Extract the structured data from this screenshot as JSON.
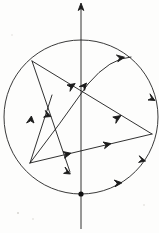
{
  "figure": {
    "title": "Circle with inscribed directed segments and arcs",
    "background_color": "#fdfdfc",
    "stroke_color": "#1b1b1b",
    "width": 159,
    "height": 233
  },
  "chart_data": {
    "type": "diagram",
    "title": "Circle with inscribed directed segments and arcs",
    "coordinate_system": "image pixels, origin top-left",
    "circle": {
      "label": "main-circle",
      "cx": 81,
      "cy": 117,
      "r": 77,
      "stroke": "#242424"
    },
    "axis": {
      "label": "vertical-axis",
      "x": 81,
      "y_top": 4,
      "y_bottom": 229,
      "arrow_at": "top",
      "arrow_point": [
        81,
        4
      ]
    },
    "points": [
      {
        "name": "A",
        "role": "upper-left-vertex",
        "x": 32,
        "y": 61
      },
      {
        "name": "B",
        "role": "lower-left-vertex",
        "x": 30,
        "y": 163
      },
      {
        "name": "C",
        "role": "right-vertex",
        "x": 152,
        "y": 134
      },
      {
        "name": "D",
        "role": "arrow-terminus-below-center",
        "x": 70,
        "y": 172
      },
      {
        "name": "E",
        "role": "axis-circle-bottom-node",
        "x": 81,
        "y": 194
      },
      {
        "name": "F",
        "role": "arc-upper-right-end",
        "x": 130,
        "y": 57
      }
    ],
    "segments": [
      {
        "name": "segment-A-to-C",
        "from": [
          32,
          61
        ],
        "to": [
          152,
          134
        ],
        "arrows": [
          {
            "t": 0.33,
            "dir": "forward"
          },
          {
            "t": 0.72,
            "dir": "forward"
          }
        ]
      },
      {
        "name": "segment-A-to-D",
        "from": [
          32,
          61
        ],
        "to": [
          70,
          172
        ],
        "arrows": [
          {
            "t": 0.48,
            "dir": "forward"
          },
          {
            "t": 1.0,
            "dir": "forward"
          }
        ]
      },
      {
        "name": "segment-B-to-A-upward",
        "from": [
          30,
          163
        ],
        "to": [
          52,
          95
        ],
        "arrows": [
          {
            "t": 0.62,
            "dir": "forward"
          }
        ]
      },
      {
        "name": "segment-B-to-C-lower",
        "from": [
          30,
          163
        ],
        "to": [
          152,
          134
        ],
        "arrows": [
          {
            "t": 0.32,
            "dir": "forward"
          },
          {
            "t": 0.72,
            "dir": "forward"
          }
        ]
      }
    ],
    "arcs": [
      {
        "name": "arc-B-to-F",
        "from": [
          30,
          163
        ],
        "to": [
          130,
          57
        ],
        "sweep": "counterclockwise-bulge-right",
        "arrows": [
          {
            "t": 0.55,
            "dir": "forward"
          },
          {
            "t": 0.93,
            "dir": "forward"
          }
        ]
      },
      {
        "name": "arc-circle-right-lower",
        "from": [
          152,
          134
        ],
        "to": [
          81,
          194
        ],
        "along": "main-circle",
        "arrows": [
          {
            "t": 0.25,
            "dir": "forward"
          },
          {
            "t": 0.65,
            "dir": "forward"
          }
        ]
      },
      {
        "name": "arc-circle-right-upper",
        "from": [
          152,
          134
        ],
        "to": [
          152,
          134
        ],
        "along": "main-circle",
        "arrows": [
          {
            "t": 0.0,
            "dir": "forward"
          }
        ]
      }
    ],
    "markers": {
      "arrowhead_style": "open-v-caret",
      "node_dot_radius": 2.6,
      "node_dots": [
        [
          81,
          194
        ]
      ]
    },
    "grid": false,
    "legend": null,
    "axis_labels": {
      "x": "",
      "y": ""
    }
  }
}
